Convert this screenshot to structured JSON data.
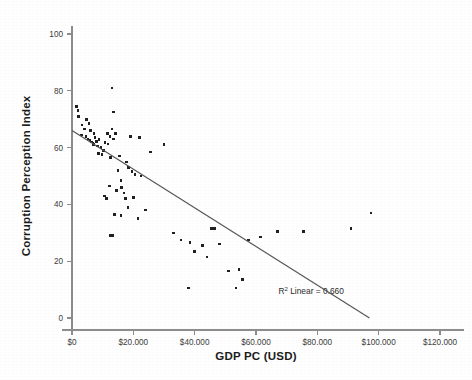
{
  "chart_data": {
    "type": "scatter",
    "title": "",
    "xlabel": "GDP PC (USD)",
    "ylabel": "Corruption Perception Index",
    "xlim": [
      0,
      120000
    ],
    "ylim": [
      0,
      100
    ],
    "grid": false,
    "legend": "none",
    "x_tick_labels": [
      "$0",
      "$20.000",
      "$40.000",
      "$60.000",
      "$80.000",
      "$100.000",
      "$120.000"
    ],
    "x_tick_values": [
      0,
      20000,
      40000,
      60000,
      80000,
      100000,
      120000
    ],
    "y_tick_labels": [
      "0",
      "20",
      "40",
      "60",
      "80",
      "100"
    ],
    "y_tick_values": [
      0,
      20,
      40,
      60,
      80,
      100
    ],
    "annotations": [
      {
        "name": "r-squared-annotation",
        "text_prefix": "R",
        "text_sup": "2",
        "text_suffix": " Linear = 0.660",
        "full_text": "R2 Linear = 0.660",
        "x": 78000,
        "y": 8.5
      }
    ],
    "fit_line": {
      "name": "linear-fit-line",
      "r_squared": 0.66,
      "intercept": 66.0,
      "slope_per_usd": -0.00068,
      "x_start": 0,
      "y_start": 66.0,
      "x_end": 97000,
      "y_end": 0.0
    },
    "series": [
      {
        "name": "countries",
        "marker": "square",
        "color": "#202020",
        "points": [
          [
            1500,
            74.5
          ],
          [
            1900,
            73.0
          ],
          [
            2200,
            71.0
          ],
          [
            3200,
            68.0
          ],
          [
            4100,
            66.5
          ],
          [
            3000,
            64.5
          ],
          [
            4600,
            64.0
          ],
          [
            5200,
            63.0
          ],
          [
            5900,
            62.5
          ],
          [
            6300,
            62.0
          ],
          [
            6800,
            61.5
          ],
          [
            7100,
            61.0
          ],
          [
            7500,
            63.5
          ],
          [
            7900,
            62.2
          ],
          [
            6000,
            66.0
          ],
          [
            7200,
            65.0
          ],
          [
            8300,
            60.5
          ],
          [
            8800,
            62.8
          ],
          [
            9400,
            60.0
          ],
          [
            10200,
            59.0
          ],
          [
            11500,
            65.0
          ],
          [
            12400,
            64.0
          ],
          [
            13000,
            66.5
          ],
          [
            14200,
            65.0
          ],
          [
            13600,
            72.5
          ],
          [
            13000,
            81.0
          ],
          [
            19000,
            64.0
          ],
          [
            22000,
            63.5
          ],
          [
            25500,
            58.5
          ],
          [
            30000,
            61.0
          ],
          [
            12500,
            56.5
          ],
          [
            15500,
            57.0
          ],
          [
            17800,
            55.0
          ],
          [
            15000,
            52.0
          ],
          [
            18500,
            53.0
          ],
          [
            19500,
            51.5
          ],
          [
            20500,
            50.5
          ],
          [
            16000,
            48.5
          ],
          [
            22500,
            50.0
          ],
          [
            12200,
            46.5
          ],
          [
            14500,
            45.0
          ],
          [
            17000,
            44.0
          ],
          [
            17500,
            42.0
          ],
          [
            10600,
            43.0
          ],
          [
            11200,
            42.0
          ],
          [
            16200,
            46.0
          ],
          [
            18200,
            39.0
          ],
          [
            13800,
            36.5
          ],
          [
            16000,
            36.0
          ],
          [
            21500,
            35.0
          ],
          [
            12500,
            29.0
          ],
          [
            13200,
            29.0
          ],
          [
            33000,
            30.0
          ],
          [
            35500,
            27.5
          ],
          [
            38500,
            26.5
          ],
          [
            40000,
            23.5
          ],
          [
            42500,
            25.5
          ],
          [
            44000,
            21.5
          ],
          [
            45500,
            31.5
          ],
          [
            46500,
            31.5
          ],
          [
            48000,
            26.0
          ],
          [
            51000,
            16.5
          ],
          [
            54500,
            17.0
          ],
          [
            55500,
            13.5
          ],
          [
            53500,
            10.5
          ],
          [
            38000,
            10.5
          ],
          [
            57500,
            27.5
          ],
          [
            61500,
            28.5
          ],
          [
            67000,
            30.5
          ],
          [
            75500,
            30.5
          ],
          [
            91000,
            31.5
          ],
          [
            97500,
            37.0
          ],
          [
            13500,
            63.0
          ],
          [
            8600,
            58.0
          ],
          [
            9800,
            57.5
          ],
          [
            10800,
            61.8
          ],
          [
            11800,
            61.2
          ],
          [
            5500,
            68.5
          ],
          [
            4800,
            70.0
          ],
          [
            20000,
            42.5
          ],
          [
            24000,
            38.0
          ]
        ]
      }
    ]
  },
  "axes": {
    "x_axis_name": "x-axis",
    "y_axis_name": "y-axis"
  }
}
